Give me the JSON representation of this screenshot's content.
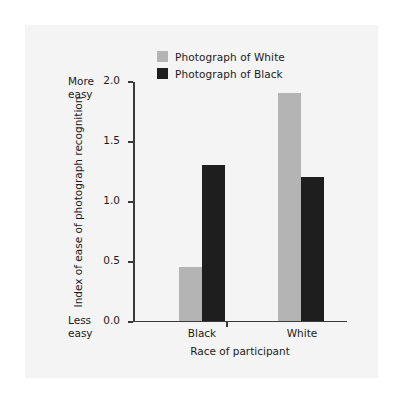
{
  "chart_data": {
    "type": "bar",
    "title": "",
    "xlabel": "Race of participant",
    "ylabel": "Index of ease of photograph recognition",
    "categories": [
      "Black",
      "White"
    ],
    "series": [
      {
        "name": "Photograph of White",
        "color": "#b4b4b4",
        "values": [
          0.45,
          1.9
        ]
      },
      {
        "name": "Photograph of Black",
        "color": "#1e1e1e",
        "values": [
          1.3,
          1.2
        ]
      }
    ],
    "ylim": [
      0.0,
      2.0
    ],
    "yticks": [
      "0.0",
      "0.5",
      "1.0",
      "1.5",
      "2.0"
    ],
    "ytick_values": [
      0.0,
      0.5,
      1.0,
      1.5,
      2.0
    ],
    "grid": false,
    "legend_position": "top-center",
    "annotations": {
      "y_axis_top": "More easy",
      "y_axis_top_line1": "More",
      "y_axis_top_line2": "easy",
      "y_axis_bottom": "Less easy",
      "y_axis_bottom_line1": "Less",
      "y_axis_bottom_line2": "easy"
    }
  },
  "figure": {
    "background_color": "#f4f4f4",
    "page_background": "#ffffff",
    "axis_color": "#3a3a3a",
    "text_color": "#1b1b1b"
  }
}
